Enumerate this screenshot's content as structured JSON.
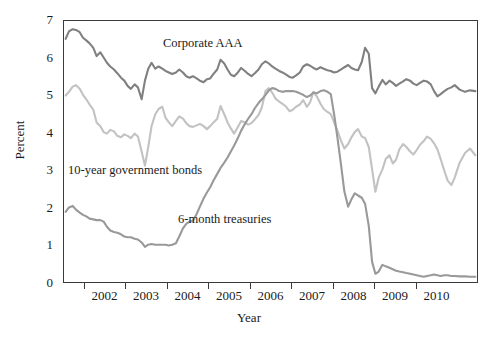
{
  "chart_data": {
    "type": "line",
    "title": "",
    "xlabel": "Year",
    "ylabel": "Percent",
    "ylim": [
      0,
      7
    ],
    "xlim": [
      2001.5,
      2011.5
    ],
    "yticks": [
      0,
      1,
      2,
      3,
      4,
      5,
      6,
      7
    ],
    "xticks": [
      2002,
      2003,
      2004,
      2005,
      2006,
      2007,
      2008,
      2009,
      2010
    ],
    "xtick_labels": [
      "2002",
      "2003",
      "2004",
      "2005",
      "2006",
      "2007",
      "2008",
      "2009",
      "2010"
    ],
    "ytick_labels": [
      "0",
      "1",
      "2",
      "3",
      "4",
      "5",
      "6",
      "7"
    ],
    "grid": false,
    "legend_position": "inline-annotations",
    "colors": {
      "corporate_aaa": "#808080",
      "ten_year_government_bonds": "#c2c2c2",
      "six_month_treasuries": "#999999",
      "axis": "#3a3a3a",
      "text": "#1a1a1a",
      "background": "#ffffff"
    },
    "annotations": [
      {
        "name": "corporate-aaa-label",
        "text": "Corporate AAA",
        "x": 2005.4,
        "y": 6.55
      },
      {
        "name": "ten-year-bonds-label",
        "text": "10-year government bonds",
        "x": 2001.65,
        "y": 3.15
      },
      {
        "name": "six-month-treasuries-label",
        "text": "6-month treasuries",
        "x": 2004.3,
        "y": 1.85
      }
    ],
    "x": [
      2001.54,
      2001.62,
      2001.71,
      2001.79,
      2001.88,
      2001.96,
      2002.04,
      2002.12,
      2002.21,
      2002.29,
      2002.38,
      2002.46,
      2002.54,
      2002.62,
      2002.71,
      2002.79,
      2002.88,
      2002.96,
      2003.04,
      2003.12,
      2003.21,
      2003.29,
      2003.38,
      2003.46,
      2003.54,
      2003.62,
      2003.71,
      2003.79,
      2003.88,
      2003.96,
      2004.04,
      2004.12,
      2004.21,
      2004.29,
      2004.38,
      2004.46,
      2004.54,
      2004.62,
      2004.71,
      2004.79,
      2004.88,
      2004.96,
      2005.04,
      2005.12,
      2005.21,
      2005.29,
      2005.38,
      2005.46,
      2005.54,
      2005.62,
      2005.71,
      2005.79,
      2005.88,
      2005.96,
      2006.04,
      2006.12,
      2006.21,
      2006.29,
      2006.38,
      2006.46,
      2006.54,
      2006.62,
      2006.71,
      2006.79,
      2006.88,
      2006.96,
      2007.04,
      2007.12,
      2007.21,
      2007.29,
      2007.38,
      2007.46,
      2007.54,
      2007.62,
      2007.71,
      2007.79,
      2007.88,
      2007.96,
      2008.04,
      2008.12,
      2008.21,
      2008.29,
      2008.38,
      2008.46,
      2008.54,
      2008.62,
      2008.71,
      2008.79,
      2008.88,
      2008.96,
      2009.04,
      2009.12,
      2009.21,
      2009.29,
      2009.38,
      2009.46,
      2009.54,
      2009.62,
      2009.71,
      2009.79,
      2009.88,
      2009.96,
      2010.04,
      2010.12,
      2010.21,
      2010.29,
      2010.38,
      2010.46,
      2010.54,
      2010.62,
      2010.71,
      2010.79,
      2010.88,
      2010.96,
      2011.08,
      2011.21,
      2011.33,
      2011.46
    ],
    "series": [
      {
        "name": "Corporate AAA",
        "color": "#808080",
        "values": [
          6.52,
          6.72,
          6.78,
          6.76,
          6.7,
          6.55,
          6.48,
          6.4,
          6.28,
          6.06,
          6.16,
          6.02,
          5.88,
          5.78,
          5.7,
          5.6,
          5.48,
          5.4,
          5.26,
          5.18,
          5.3,
          5.22,
          4.9,
          5.4,
          5.72,
          5.88,
          5.72,
          5.78,
          5.72,
          5.66,
          5.62,
          5.58,
          5.62,
          5.7,
          5.62,
          5.52,
          5.48,
          5.52,
          5.46,
          5.4,
          5.36,
          5.44,
          5.46,
          5.58,
          5.7,
          5.96,
          5.86,
          5.7,
          5.56,
          5.52,
          5.62,
          5.74,
          5.66,
          5.58,
          5.52,
          5.6,
          5.7,
          5.84,
          5.92,
          5.86,
          5.78,
          5.72,
          5.66,
          5.62,
          5.56,
          5.5,
          5.48,
          5.54,
          5.62,
          5.78,
          5.84,
          5.8,
          5.74,
          5.7,
          5.76,
          5.72,
          5.68,
          5.66,
          5.62,
          5.64,
          5.7,
          5.76,
          5.82,
          5.74,
          5.7,
          5.68,
          5.9,
          6.28,
          6.12,
          5.2,
          5.06,
          5.24,
          5.42,
          5.3,
          5.4,
          5.34,
          5.26,
          5.32,
          5.38,
          5.44,
          5.4,
          5.32,
          5.28,
          5.34,
          5.4,
          5.38,
          5.3,
          5.12,
          4.98,
          5.04,
          5.12,
          5.18,
          5.22,
          5.28,
          5.16,
          5.1,
          5.14,
          5.12
        ]
      },
      {
        "name": "10-year government bonds",
        "color": "#c2c2c2",
        "values": [
          5.0,
          5.1,
          5.24,
          5.28,
          5.18,
          5.02,
          4.9,
          4.76,
          4.62,
          4.28,
          4.18,
          4.02,
          3.98,
          4.08,
          4.04,
          3.92,
          3.88,
          3.96,
          3.92,
          3.86,
          3.98,
          3.9,
          3.5,
          3.12,
          3.62,
          4.18,
          4.5,
          4.64,
          4.7,
          4.4,
          4.28,
          4.18,
          4.32,
          4.44,
          4.38,
          4.26,
          4.18,
          4.16,
          4.2,
          4.24,
          4.18,
          4.1,
          4.18,
          4.28,
          4.38,
          4.72,
          4.5,
          4.28,
          4.12,
          3.98,
          4.16,
          4.32,
          4.28,
          4.22,
          4.26,
          4.36,
          4.48,
          4.68,
          5.12,
          5.2,
          5.08,
          4.92,
          4.84,
          4.78,
          4.7,
          4.58,
          4.62,
          4.7,
          4.76,
          4.88,
          4.7,
          4.82,
          5.1,
          4.98,
          4.78,
          4.64,
          4.56,
          4.5,
          4.28,
          4.06,
          3.78,
          3.58,
          3.7,
          3.88,
          4.02,
          4.1,
          3.9,
          3.86,
          3.62,
          3.02,
          2.42,
          2.8,
          3.02,
          3.3,
          3.4,
          3.18,
          3.28,
          3.56,
          3.7,
          3.62,
          3.5,
          3.42,
          3.54,
          3.68,
          3.78,
          3.9,
          3.84,
          3.72,
          3.56,
          3.3,
          2.98,
          2.72,
          2.6,
          2.8,
          3.2,
          3.46,
          3.58,
          3.4
        ]
      },
      {
        "name": "6-month treasuries",
        "color": "#999999",
        "values": [
          1.88,
          2.0,
          2.04,
          1.94,
          1.86,
          1.8,
          1.76,
          1.7,
          1.68,
          1.66,
          1.66,
          1.62,
          1.48,
          1.38,
          1.34,
          1.32,
          1.28,
          1.22,
          1.2,
          1.2,
          1.16,
          1.14,
          1.06,
          0.94,
          1.0,
          1.02,
          1.0,
          1.0,
          1.0,
          1.0,
          0.98,
          1.0,
          1.04,
          1.22,
          1.44,
          1.56,
          1.62,
          1.64,
          1.82,
          2.02,
          2.24,
          2.4,
          2.54,
          2.72,
          2.9,
          3.06,
          3.2,
          3.34,
          3.5,
          3.66,
          3.86,
          4.06,
          4.24,
          4.38,
          4.5,
          4.66,
          4.8,
          4.9,
          5.02,
          5.14,
          5.2,
          5.18,
          5.12,
          5.1,
          5.12,
          5.12,
          5.12,
          5.1,
          5.06,
          5.02,
          4.96,
          5.0,
          5.08,
          5.06,
          5.12,
          5.14,
          5.1,
          5.04,
          4.5,
          3.88,
          3.12,
          2.42,
          2.02,
          2.22,
          2.38,
          2.32,
          2.26,
          2.1,
          1.5,
          0.54,
          0.22,
          0.28,
          0.46,
          0.42,
          0.38,
          0.34,
          0.3,
          0.28,
          0.26,
          0.24,
          0.22,
          0.2,
          0.18,
          0.16,
          0.14,
          0.16,
          0.18,
          0.2,
          0.18,
          0.16,
          0.18,
          0.18,
          0.16,
          0.16,
          0.15,
          0.15,
          0.14,
          0.14
        ]
      }
    ]
  },
  "axes": {
    "ylabel": "Percent",
    "xlabel": "Year"
  }
}
